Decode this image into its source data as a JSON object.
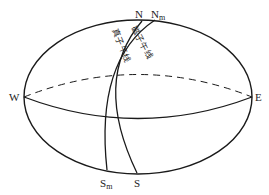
{
  "diagram": {
    "type": "celestial-sphere-meridians",
    "labels": {
      "north_true": "N",
      "north_magnetic": "N",
      "north_magnetic_sub": "m",
      "south_true": "S",
      "south_magnetic": "S",
      "south_magnetic_sub": "m",
      "west": "W",
      "east": "E",
      "true_meridian": "真子午线",
      "magnetic_meridian": "磁子午线"
    },
    "colors": {
      "stroke": "#1a1a1a",
      "background": "#ffffff"
    }
  }
}
